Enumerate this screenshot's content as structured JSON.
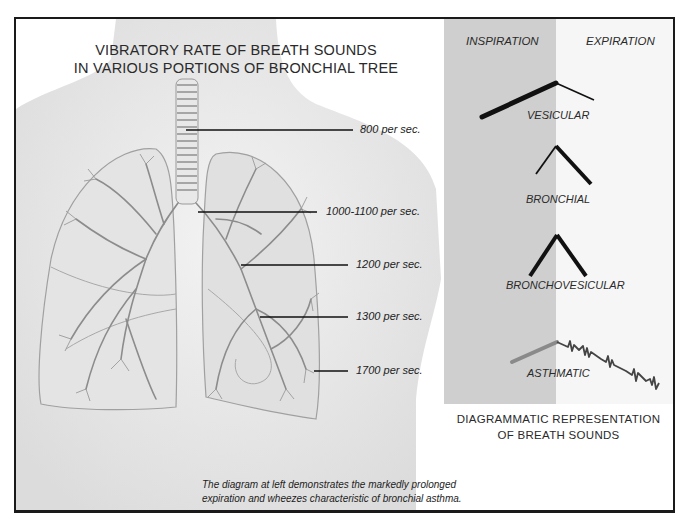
{
  "title": {
    "line1": "VIBRATORY RATE OF BREATH SOUNDS",
    "line2": "IN VARIOUS PORTIONS OF BRONCHIAL TREE"
  },
  "vibratory_rates": [
    {
      "label": "800 per sec.",
      "region": "trachea"
    },
    {
      "label": "1000-1100 per sec.",
      "region": "main bronchus"
    },
    {
      "label": "1200 per sec.",
      "region": "lobar bronchus"
    },
    {
      "label": "1300 per sec.",
      "region": "segmental bronchi"
    },
    {
      "label": "1700 per sec.",
      "region": "peripheral bronchioles"
    }
  ],
  "breath_sounds": {
    "phases": {
      "inspiration": "INSPIRATION",
      "expiration": "EXPIRATION"
    },
    "types": [
      {
        "label": "VESICULAR"
      },
      {
        "label": "BRONCHIAL"
      },
      {
        "label": "BRONCHOVESICULAR"
      },
      {
        "label": "ASTHMATIC"
      }
    ],
    "caption_line1": "DIAGRAMMATIC REPRESENTATION",
    "caption_line2": "OF BREATH SOUNDS"
  },
  "footnote": {
    "line1": "The diagram at left demonstrates the markedly prolonged",
    "line2": "expiration and wheezes characteristic of bronchial asthma."
  },
  "colors": {
    "inspiration_band": "#cfcfcf",
    "expiration_band": "#f6f6f6",
    "line": "#111111",
    "asthmatic_inspiration": "#8a8a8a"
  }
}
